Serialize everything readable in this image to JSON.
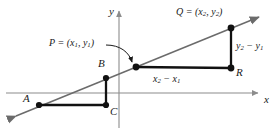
{
  "figure": {
    "kind": "coordinate-geometry-slope-diagram",
    "background_color": "#ffffff",
    "line_color": "#6b6b6b",
    "axis_color": "#8c8c8c",
    "segment_color": "#111111",
    "text_color": "#1a1a1a"
  },
  "axes": {
    "x_label": "x",
    "y_label": "y",
    "origin": {
      "x": 119,
      "y": 93
    },
    "x_axis": {
      "x1": 6,
      "y1": 93,
      "x2": 262,
      "y2": 93,
      "arrow": "right"
    },
    "y_axis": {
      "x1": 119,
      "y1": 128,
      "x2": 119,
      "y2": 8,
      "arrow": "up"
    }
  },
  "line": {
    "name": "slope-line",
    "x1": 12,
    "y1": 118,
    "x2": 263,
    "y2": 15,
    "arrows": "both"
  },
  "points": [
    {
      "id": "A",
      "label": "A",
      "x": 39,
      "y": 105,
      "label_x": 24,
      "label_y": 96
    },
    {
      "id": "B",
      "label": "B",
      "x": 106,
      "y": 78,
      "label_x": 99,
      "label_y": 61
    },
    {
      "id": "C",
      "label": "C",
      "x": 106,
      "y": 105,
      "label_x": 110,
      "label_y": 107
    },
    {
      "id": "P",
      "label": "P",
      "x": 136,
      "y": 67,
      "label_x": null,
      "label_y": null
    },
    {
      "id": "Q",
      "label": "Q",
      "x": 231,
      "y": 28,
      "label_x": null,
      "label_y": null
    },
    {
      "id": "R",
      "label": "R",
      "x": 231,
      "y": 68,
      "label_x": 236,
      "label_y": 70
    }
  ],
  "labels": {
    "point_p": {
      "text": "P = (x₁, y₁)",
      "p": "P",
      "eq": " = (",
      "x_var": "x",
      "x_sub": "1",
      "comma": ", ",
      "y_var": "y",
      "y_sub": "1",
      "close": ")"
    },
    "point_q": {
      "text": "Q = (x₂, y₂)",
      "q": "Q",
      "eq": " = (",
      "x_var": "x",
      "x_sub": "2",
      "comma": ", ",
      "y_var": "y",
      "y_sub": "2",
      "close": ")"
    },
    "run": {
      "text": "x₂ − x₁",
      "first": "x",
      "first_sub": "2",
      "minus": " − ",
      "second": "x",
      "second_sub": "1"
    },
    "rise": {
      "text": "y₂ − y₁",
      "first": "y",
      "first_sub": "2",
      "minus": " − ",
      "second": "y",
      "second_sub": "1"
    }
  },
  "segments": [
    {
      "name": "segment-AC",
      "from": "A",
      "to": "C",
      "x1": 39,
      "y1": 105,
      "x2": 106,
      "y2": 105
    },
    {
      "name": "segment-BC",
      "from": "B",
      "to": "C",
      "x1": 106,
      "y1": 78,
      "x2": 106,
      "y2": 105
    },
    {
      "name": "segment-PR",
      "from": "P",
      "to": "R",
      "x1": 136,
      "y1": 67,
      "x2": 231,
      "y2": 68
    },
    {
      "name": "segment-QR",
      "from": "Q",
      "to": "R",
      "x1": 231,
      "y1": 28,
      "x2": 231,
      "y2": 68
    }
  ],
  "annotation_arrow": {
    "name": "p-callout-arrow",
    "path": "M 107,45 C 121,45 130,52 133,63",
    "tip_x": 136,
    "tip_y": 66
  }
}
